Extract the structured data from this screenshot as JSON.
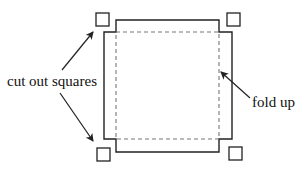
{
  "diagram": {
    "labels": {
      "cut_out_squares": "cut out squares",
      "fold_up": "fold up"
    },
    "colors": {
      "stroke": "#222222",
      "dashed": "#777777",
      "background": "#ffffff"
    },
    "elements": {
      "cut_squares": [
        "top-left",
        "top-right",
        "bottom-left",
        "bottom-right"
      ],
      "outline": "sheet outline with corners removed",
      "fold_lines": "dashed inner rectangle"
    }
  }
}
